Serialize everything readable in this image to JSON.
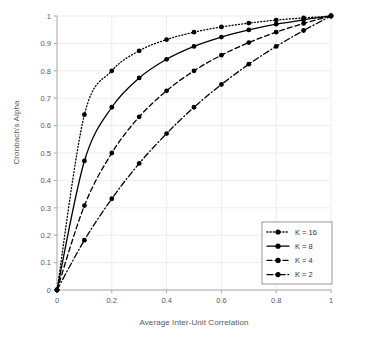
{
  "chart_data": {
    "type": "line",
    "title": "",
    "xlabel": "Average Inter-Unit Correlation",
    "ylabel": "Cronbach's Alpha",
    "xlim": [
      0,
      1
    ],
    "ylim": [
      0,
      1
    ],
    "grid": true,
    "legend_position": "bottom-right",
    "x": [
      0,
      0.1,
      0.2,
      0.3,
      0.4,
      0.5,
      0.6,
      0.7,
      0.8,
      0.9,
      1
    ],
    "xticks": [
      0,
      0.2,
      0.4,
      0.6,
      0.8,
      1
    ],
    "xticklabels": [
      "0",
      "0.2",
      "0.4",
      "0.6",
      "0.8",
      "1"
    ],
    "yticks": [
      0,
      0.1,
      0.2,
      0.3,
      0.4,
      0.5,
      0.6,
      0.7,
      0.8,
      0.9,
      1
    ],
    "yticklabels": [
      "0",
      "0.1",
      "0.2",
      "0.3",
      "0.4",
      "0.5",
      "0.6",
      "0.7",
      "0.8",
      "0.9",
      "1"
    ],
    "series": [
      {
        "name": "K = 16",
        "style": "dotted",
        "color": "#000000",
        "values": [
          0,
          0.64,
          0.8,
          0.873,
          0.914,
          0.941,
          0.96,
          0.974,
          0.985,
          0.993,
          1
        ]
      },
      {
        "name": "K = 8",
        "style": "solid",
        "color": "#000000",
        "values": [
          0,
          0.471,
          0.667,
          0.774,
          0.842,
          0.889,
          0.923,
          0.949,
          0.97,
          0.986,
          1
        ]
      },
      {
        "name": "K = 4",
        "style": "dashed",
        "color": "#000000",
        "values": [
          0,
          0.308,
          0.5,
          0.632,
          0.727,
          0.8,
          0.857,
          0.903,
          0.941,
          0.973,
          1
        ]
      },
      {
        "name": "K = 2",
        "style": "dashdot",
        "color": "#000000",
        "values": [
          0,
          0.182,
          0.333,
          0.462,
          0.571,
          0.667,
          0.75,
          0.824,
          0.889,
          0.947,
          1
        ]
      }
    ]
  },
  "legend": {
    "entries": [
      {
        "label": "K = 16"
      },
      {
        "label": "K = 8"
      },
      {
        "label": "K = 4"
      },
      {
        "label": "K = 2"
      }
    ]
  }
}
